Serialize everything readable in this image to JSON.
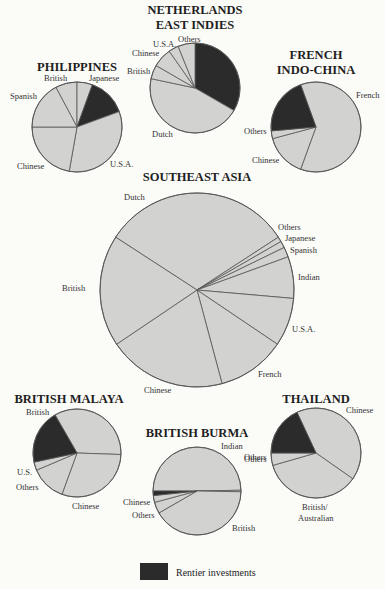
{
  "chart_data": [
    {
      "type": "pie",
      "title": "PHILIPPINES",
      "cx": 77,
      "cy": 127,
      "r": 45,
      "slices": [
        {
          "label": "British",
          "start": -28,
          "end": 0,
          "rentier": false
        },
        {
          "label": "Japanese",
          "start": 0,
          "end": 20,
          "rentier": false
        },
        {
          "label": "Rentier investments",
          "start": 20,
          "end": 70,
          "rentier": true
        },
        {
          "label": "U.S.A.",
          "start": 70,
          "end": 190,
          "rentier": false
        },
        {
          "label": "Chinese",
          "start": 190,
          "end": 270,
          "rentier": false
        },
        {
          "label": "Spanish",
          "start": 270,
          "end": 332,
          "rentier": false
        }
      ],
      "labels": [
        {
          "text": "British",
          "x": 44,
          "y": 81
        },
        {
          "text": "Japanese",
          "x": 89,
          "y": 81
        },
        {
          "text": "Spanish",
          "x": 10,
          "y": 99
        },
        {
          "text": "Chinese",
          "x": 17,
          "y": 169
        },
        {
          "text": "U.S.A.",
          "x": 110,
          "y": 167
        }
      ]
    },
    {
      "type": "pie",
      "title": "NETHERLANDS EAST INDIES",
      "title_lines": [
        "NETHERLANDS",
        "EAST INDIES"
      ],
      "cx": 195,
      "cy": 88,
      "r": 45,
      "slices": [
        {
          "label": "Rentier investments",
          "start": 0,
          "end": 120,
          "rentier": true
        },
        {
          "label": "Dutch",
          "start": 120,
          "end": 282,
          "rentier": false
        },
        {
          "label": "British",
          "start": 282,
          "end": 300,
          "rentier": false
        },
        {
          "label": "Chinese",
          "start": 300,
          "end": 325,
          "rentier": false
        },
        {
          "label": "U.S.A.",
          "start": 325,
          "end": 338,
          "rentier": false
        },
        {
          "label": "Others",
          "start": 338,
          "end": 360,
          "rentier": false
        }
      ],
      "labels": [
        {
          "text": "Others",
          "x": 178,
          "y": 42
        },
        {
          "text": "U.S.A.",
          "x": 153,
          "y": 47
        },
        {
          "text": "Chinese",
          "x": 132,
          "y": 56
        },
        {
          "text": "British",
          "x": 127,
          "y": 74
        },
        {
          "text": "Dutch",
          "x": 152,
          "y": 137
        }
      ]
    },
    {
      "type": "pie",
      "title": "FRENCH INDO-CHINA",
      "title_lines": [
        "FRENCH",
        "INDO-CHINA"
      ],
      "cx": 316,
      "cy": 127,
      "r": 45,
      "slices": [
        {
          "label": "French",
          "start": -20,
          "end": 200,
          "rentier": false
        },
        {
          "label": "Chinese",
          "start": 200,
          "end": 255,
          "rentier": false
        },
        {
          "label": "Others",
          "start": 255,
          "end": 265,
          "rentier": false
        },
        {
          "label": "Rentier investments",
          "start": 265,
          "end": 340,
          "rentier": true
        }
      ],
      "labels": [
        {
          "text": "French",
          "x": 356,
          "y": 98
        },
        {
          "text": "Others",
          "x": 244,
          "y": 134
        },
        {
          "text": "Chinese",
          "x": 252,
          "y": 163
        }
      ]
    },
    {
      "type": "pie",
      "title": "SOUTHEAST ASIA",
      "cx": 197,
      "cy": 290,
      "r": 97,
      "slices": [
        {
          "label": "Dutch",
          "start": -57,
          "end": 57,
          "rentier": false
        },
        {
          "label": "Others",
          "start": 57,
          "end": 60,
          "rentier": false
        },
        {
          "label": "Japanese",
          "start": 60,
          "end": 64,
          "rentier": false
        },
        {
          "label": "Spanish",
          "start": 64,
          "end": 70,
          "rentier": false
        },
        {
          "label": "Indian",
          "start": 70,
          "end": 95,
          "rentier": false
        },
        {
          "label": "U.S.A.",
          "start": 95,
          "end": 124,
          "rentier": false
        },
        {
          "label": "French",
          "start": 124,
          "end": 165,
          "rentier": false
        },
        {
          "label": "Chinese",
          "start": 165,
          "end": 236,
          "rentier": false
        },
        {
          "label": "British",
          "start": 236,
          "end": 303,
          "rentier": false
        }
      ],
      "labels": [
        {
          "text": "Dutch",
          "x": 124,
          "y": 200
        },
        {
          "text": "Others",
          "x": 278,
          "y": 230
        },
        {
          "text": "Japanese",
          "x": 285,
          "y": 241
        },
        {
          "text": "Spanish",
          "x": 290,
          "y": 253
        },
        {
          "text": "Indian",
          "x": 298,
          "y": 280
        },
        {
          "text": "U.S.A.",
          "x": 292,
          "y": 332
        },
        {
          "text": "French",
          "x": 258,
          "y": 377
        },
        {
          "text": "Chinese",
          "x": 144,
          "y": 393
        },
        {
          "text": "British",
          "x": 62,
          "y": 291
        }
      ]
    },
    {
      "type": "pie",
      "title": "BRITISH MALAYA",
      "cx": 77,
      "cy": 453,
      "r": 44,
      "slices": [
        {
          "label": "British",
          "start": -30,
          "end": 92,
          "rentier": false
        },
        {
          "label": "Chinese",
          "start": 92,
          "end": 200,
          "rentier": false
        },
        {
          "label": "Others",
          "start": 200,
          "end": 247,
          "rentier": false
        },
        {
          "label": "U.S.",
          "start": 247,
          "end": 258,
          "rentier": false
        },
        {
          "label": "Rentier investments",
          "start": 258,
          "end": 330,
          "rentier": true
        }
      ],
      "labels": [
        {
          "text": "British",
          "x": 26,
          "y": 415
        },
        {
          "text": "U.S.",
          "x": 17,
          "y": 475
        },
        {
          "text": "Others",
          "x": 16,
          "y": 490
        },
        {
          "text": "Chinese",
          "x": 72,
          "y": 509
        }
      ]
    },
    {
      "type": "pie",
      "title": "BRITISH BURMA",
      "cx": 197,
      "cy": 491,
      "r": 44,
      "slices": [
        {
          "label": "Indian",
          "start": -90,
          "end": 89,
          "rentier": false
        },
        {
          "label": "Others",
          "start": 89,
          "end": 91,
          "rentier": false
        },
        {
          "label": "British",
          "start": 91,
          "end": 240,
          "rentier": false
        },
        {
          "label": "Others",
          "start": 240,
          "end": 255,
          "rentier": false
        },
        {
          "label": "Chinese",
          "start": 255,
          "end": 264,
          "rentier": false
        },
        {
          "label": "Rentier investments",
          "start": 264,
          "end": 270,
          "rentier": true
        }
      ],
      "labels": [
        {
          "text": "Indian",
          "x": 221,
          "y": 449
        },
        {
          "text": "Others",
          "x": 244,
          "y": 460
        },
        {
          "text": "Chinese",
          "x": 123,
          "y": 505
        },
        {
          "text": "Others",
          "x": 132,
          "y": 518
        },
        {
          "text": "British",
          "x": 232,
          "y": 531
        }
      ]
    },
    {
      "type": "pie",
      "title": "THAILAND",
      "cx": 316,
      "cy": 453,
      "r": 45,
      "slices": [
        {
          "label": "Chinese",
          "start": -25,
          "end": 125,
          "rentier": false
        },
        {
          "label": "British/ Australian",
          "start": 125,
          "end": 254,
          "rentier": false
        },
        {
          "label": "Others",
          "start": 254,
          "end": 270,
          "rentier": false
        },
        {
          "label": "Rentier investments",
          "start": 270,
          "end": 335,
          "rentier": true
        }
      ],
      "labels": [
        {
          "text": "Chinese",
          "x": 346,
          "y": 413
        },
        {
          "text": "Others",
          "x": 244,
          "y": 462
        },
        {
          "text": "British/",
          "x": 302,
          "y": 510
        },
        {
          "text": "Australian",
          "x": 298,
          "y": 521
        }
      ]
    }
  ],
  "legend": {
    "label": "Rentier investments",
    "color": "#2b2b2b"
  },
  "colors": {
    "slice_fill": "#d2d2d0",
    "rentier_fill": "#2b2b2b",
    "stroke": "#555555",
    "background": "#fbfbf8"
  },
  "titles_pos": [
    {
      "x": 77,
      "y": 71
    },
    {
      "x": 195,
      "y": 14
    },
    {
      "x": 316,
      "y": 59
    },
    {
      "x": 197,
      "y": 181
    },
    {
      "x": 69,
      "y": 403
    },
    {
      "x": 197,
      "y": 437
    },
    {
      "x": 316,
      "y": 403
    }
  ]
}
